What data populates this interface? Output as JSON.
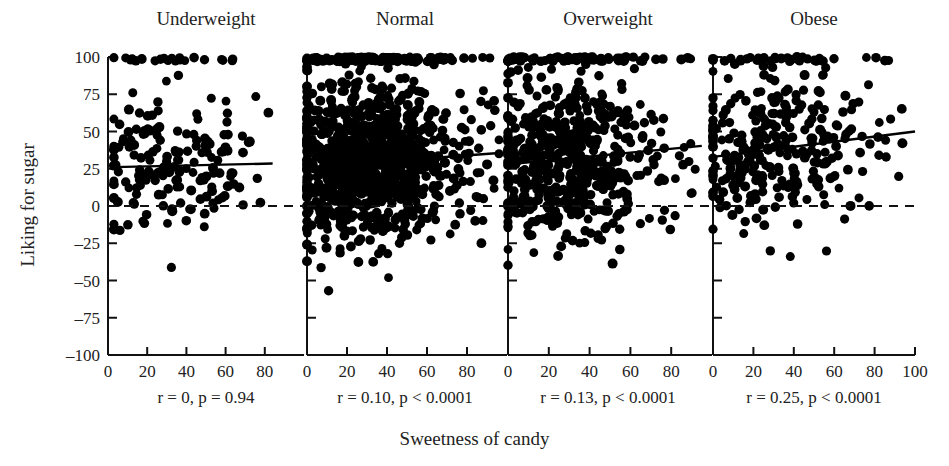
{
  "figure": {
    "xlabel": "Sweetness of candy",
    "ylabel": "Liking for sugar"
  },
  "chart_data": {
    "type": "scatter",
    "title": "",
    "subtitle": "",
    "xlabel": "Sweetness of candy",
    "ylabel": "Liking for sugar",
    "xlim": [
      0,
      100
    ],
    "ylim": [
      -100,
      100
    ],
    "xticks": [
      0,
      20,
      40,
      60,
      80,
      100
    ],
    "yticks": [
      -100,
      -75,
      -50,
      -25,
      0,
      25,
      50,
      75,
      100
    ],
    "grid": false,
    "legend": "none",
    "reference_lines": [
      {
        "name": "zero-line",
        "orientation": "horizontal",
        "y": 0,
        "style": "dashed"
      }
    ],
    "panels": [
      {
        "label": "Underweight",
        "stat_text": "r = 0, p = 0.94",
        "r": 0,
        "p_text": "p = 0.94",
        "n_points": 185,
        "xticks_shown": [
          0,
          20,
          40,
          60,
          80
        ],
        "fit_line": {
          "y_at_x0": 26,
          "y_at_x100": 29,
          "slope": 0.03
        },
        "x_range_observed": [
          3,
          84
        ],
        "y_mean_observed": 26
      },
      {
        "label": "Normal",
        "stat_text": "r = 0.10, p < 0.0001",
        "r": 0.1,
        "p_text": "p < 0.0001",
        "n_points": 1150,
        "xticks_shown": [
          0,
          20,
          40,
          60,
          80
        ],
        "fit_line": {
          "y_at_x0": 26,
          "y_at_x100": 36,
          "slope": 0.1
        },
        "x_range_observed": [
          0,
          96
        ],
        "y_mean_observed": 30
      },
      {
        "label": "Overweight",
        "stat_text": "r = 0.13, p < 0.0001",
        "r": 0.13,
        "p_text": "p < 0.0001",
        "n_points": 620,
        "xticks_shown": [
          0,
          20,
          40,
          60,
          80
        ],
        "fit_line": {
          "y_at_x0": 28,
          "y_at_x100": 41,
          "slope": 0.13
        },
        "x_range_observed": [
          0,
          95
        ],
        "y_mean_observed": 32
      },
      {
        "label": "Obese",
        "stat_text": "r = 0.25, p < 0.0001",
        "r": 0.25,
        "p_text": "p < 0.0001",
        "n_points": 330,
        "xticks_shown": [
          0,
          20,
          40,
          60,
          80,
          100
        ],
        "fit_line": {
          "y_at_x0": 33,
          "y_at_x100": 50,
          "slope": 0.17
        },
        "x_range_observed": [
          0,
          100
        ],
        "y_mean_observed": 36
      }
    ],
    "marker": {
      "shape": "circle",
      "color": "#000000",
      "size_px": 9
    }
  }
}
